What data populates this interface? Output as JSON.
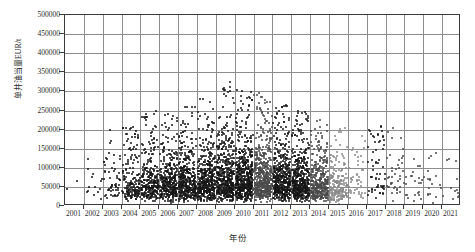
{
  "chart_data": {
    "type": "scatter",
    "title": "",
    "xlabel": "年份",
    "ylabel": "单井油当量EUR/t",
    "xlim": [
      2000.5,
      2021.5
    ],
    "ylim": [
      0,
      500000
    ],
    "grid": true,
    "legend": null,
    "xtick_labels": [
      "2001",
      "2002",
      "2003",
      "2004",
      "2005",
      "2006",
      "2007",
      "2008",
      "2009",
      "2010",
      "2011",
      "2012",
      "2013",
      "2014",
      "2015",
      "2016",
      "2017",
      "2018",
      "2019",
      "2020",
      "2021"
    ],
    "ytick_labels": [
      "0",
      "50000",
      "100000",
      "150000",
      "200000",
      "250000",
      "300000",
      "350000",
      "400000",
      "450000",
      "500000"
    ],
    "ytick_values": [
      0,
      50000,
      100000,
      150000,
      200000,
      250000,
      300000,
      350000,
      400000,
      450000,
      500000
    ],
    "marker": "filled-circle",
    "marker_color_dense": "#1a1a1a",
    "marker_color_sparse": "#6f6f6f",
    "series": [
      {
        "name": "单井油当量EUR",
        "description": "Single-well oil-equivalent EUR per well by spud year; dense black cluster 2004-2015 mostly below 150000 t, sparse grey points 2016-2021.",
        "density_profile": [
          {
            "year": 2001,
            "count": 2,
            "median": 55000,
            "p90": 110000,
            "max": 130000,
            "shade": "dark"
          },
          {
            "year": 2002,
            "count": 14,
            "median": 62000,
            "p90": 120000,
            "max": 140000,
            "shade": "dark"
          },
          {
            "year": 2003,
            "count": 55,
            "median": 58000,
            "p90": 118000,
            "max": 200000,
            "shade": "dark"
          },
          {
            "year": 2004,
            "count": 170,
            "median": 56000,
            "p90": 122000,
            "max": 215000,
            "shade": "dark"
          },
          {
            "year": 2005,
            "count": 260,
            "median": 58000,
            "p90": 128000,
            "max": 250000,
            "shade": "dark"
          },
          {
            "year": 2006,
            "count": 330,
            "median": 60000,
            "p90": 132000,
            "max": 245000,
            "shade": "dark"
          },
          {
            "year": 2007,
            "count": 380,
            "median": 62000,
            "p90": 138000,
            "max": 265000,
            "shade": "dark"
          },
          {
            "year": 2008,
            "count": 430,
            "median": 64000,
            "p90": 142000,
            "max": 290000,
            "shade": "dark"
          },
          {
            "year": 2009,
            "count": 470,
            "median": 66000,
            "p90": 150000,
            "max": 330000,
            "shade": "dark"
          },
          {
            "year": 2010,
            "count": 520,
            "median": 68000,
            "p90": 155000,
            "max": 325000,
            "shade": "dark"
          },
          {
            "year": 2011,
            "count": 500,
            "median": 66000,
            "p90": 150000,
            "max": 300000,
            "shade": "mid"
          },
          {
            "year": 2012,
            "count": 470,
            "median": 64000,
            "p90": 145000,
            "max": 265000,
            "shade": "dark"
          },
          {
            "year": 2013,
            "count": 440,
            "median": 62000,
            "p90": 140000,
            "max": 255000,
            "shade": "dark"
          },
          {
            "year": 2014,
            "count": 360,
            "median": 58000,
            "p90": 132000,
            "max": 230000,
            "shade": "mid"
          },
          {
            "year": 2015,
            "count": 200,
            "median": 52000,
            "p90": 120000,
            "max": 205000,
            "shade": "light"
          },
          {
            "year": 2016,
            "count": 45,
            "median": 60000,
            "p90": 130000,
            "max": 190000,
            "shade": "light"
          },
          {
            "year": 2017,
            "count": 60,
            "median": 85000,
            "p90": 165000,
            "max": 210000,
            "shade": "dark"
          },
          {
            "year": 2018,
            "count": 40,
            "median": 70000,
            "p90": 150000,
            "max": 205000,
            "shade": "mid"
          },
          {
            "year": 2019,
            "count": 22,
            "median": 60000,
            "p90": 120000,
            "max": 175000,
            "shade": "mid"
          },
          {
            "year": 2020,
            "count": 18,
            "median": 55000,
            "p90": 115000,
            "max": 160000,
            "shade": "mid"
          },
          {
            "year": 2021,
            "count": 12,
            "median": 50000,
            "p90": 105000,
            "max": 150000,
            "shade": "mid"
          }
        ]
      }
    ]
  }
}
